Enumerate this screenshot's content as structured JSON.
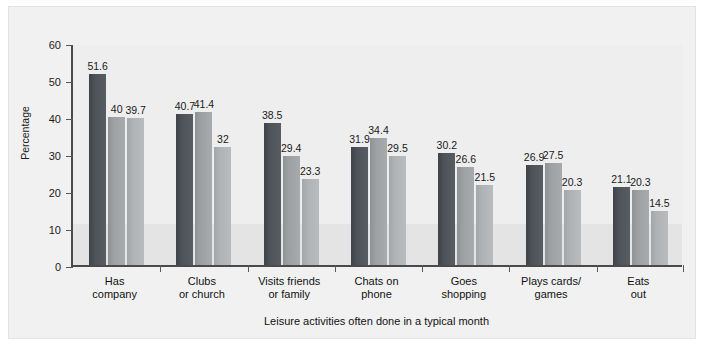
{
  "chart_data": {
    "type": "bar",
    "title": "",
    "xlabel": "Leisure activities often done in a typical month",
    "ylabel": "Percentage",
    "ylim": [
      0,
      60
    ],
    "yticks": [
      0,
      10,
      20,
      30,
      40,
      50,
      60
    ],
    "grid": false,
    "legend_position": "top-center",
    "categories": [
      "Has company",
      "Clubs or church",
      "Visits friends or family",
      "Chats on phone",
      "Goes shopping",
      "Plays cards/ games",
      "Eats out"
    ],
    "category_lines": [
      [
        "Has",
        "company"
      ],
      [
        "Clubs",
        "or church"
      ],
      [
        "Visits friends",
        "or family"
      ],
      [
        "Chats on",
        "phone"
      ],
      [
        "Goes",
        "shopping"
      ],
      [
        "Plays cards/",
        "games"
      ],
      [
        "Eats",
        "out"
      ]
    ],
    "series": [
      {
        "name": "65–74",
        "color": "#4e5358",
        "values": [
          51.6,
          40.7,
          38.5,
          31.9,
          30.2,
          26.9,
          21.1
        ],
        "labels": [
          "51.6",
          "40.7",
          "38.5",
          "31.9",
          "30.2",
          "26.9",
          "21.1"
        ]
      },
      {
        "name": "75–84",
        "color": "#9ea1a4",
        "values": [
          40,
          41.4,
          29.4,
          34.4,
          26.6,
          27.5,
          20.3
        ],
        "labels": [
          "40",
          "41.4",
          "29.4",
          "34.4",
          "26.6",
          "27.5",
          "20.3"
        ]
      },
      {
        "name": "85+",
        "color": "#b0b3b6",
        "values": [
          39.7,
          32,
          23.3,
          29.5,
          21.5,
          20.3,
          14.5
        ],
        "labels": [
          "39.7",
          "32",
          "23.3",
          "29.5",
          "21.5",
          "20.3",
          "14.5"
        ]
      }
    ]
  },
  "axis": {
    "y_tick_labels": [
      "0",
      "10",
      "20",
      "30",
      "40",
      "50",
      "60"
    ],
    "y_title": "Percentage",
    "x_title": "Leisure activities often done in a typical month"
  },
  "legend": {
    "items": [
      {
        "label": "65–74",
        "color": "#4e5358"
      },
      {
        "label": "75–84",
        "color": "#9ea1a4"
      },
      {
        "label": "85+",
        "color": "#b0b3b6"
      }
    ]
  }
}
